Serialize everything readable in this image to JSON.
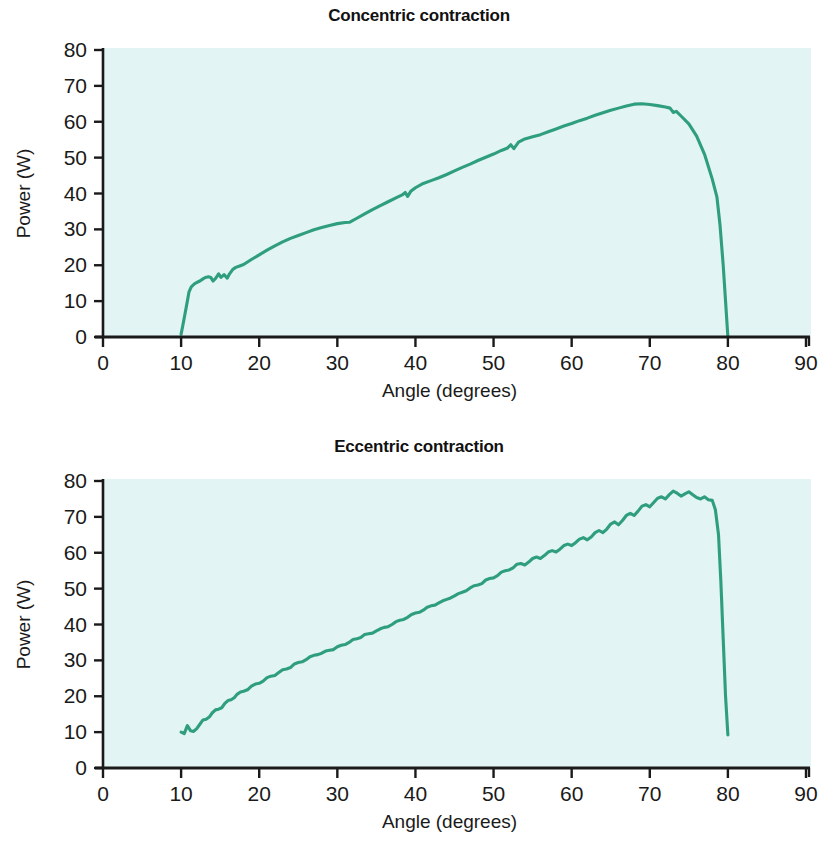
{
  "figure": {
    "background": "#ffffff",
    "plot_background": "#e2f4f3",
    "line_color": "#2e9e7e",
    "axis_color": "#1a1a1a"
  },
  "charts": [
    {
      "id": "concentric",
      "title": "Concentric contraction",
      "xlabel": "Angle (degrees)",
      "ylabel": "Power (W)",
      "xticks": [
        "0",
        "10",
        "20",
        "30",
        "40",
        "50",
        "60",
        "70",
        "80",
        "90"
      ],
      "yticks": [
        "0",
        "10",
        "20",
        "30",
        "40",
        "50",
        "60",
        "70",
        "80"
      ]
    },
    {
      "id": "eccentric",
      "title": "Eccentric contraction",
      "xlabel": "Angle (degrees)",
      "ylabel": "Power (W)",
      "xticks": [
        "0",
        "10",
        "20",
        "30",
        "40",
        "50",
        "60",
        "70",
        "80",
        "90"
      ],
      "yticks": [
        "0",
        "10",
        "20",
        "30",
        "40",
        "50",
        "60",
        "70",
        "80"
      ]
    }
  ],
  "chart_data": [
    {
      "type": "line",
      "title": "Concentric contraction",
      "xlabel": "Angle (degrees)",
      "ylabel": "Power (W)",
      "xlim": [
        0,
        90
      ],
      "ylim": [
        0,
        80
      ],
      "xticks": [
        0,
        10,
        20,
        30,
        40,
        50,
        60,
        70,
        80,
        90
      ],
      "yticks": [
        0,
        10,
        20,
        30,
        40,
        50,
        60,
        70,
        80
      ],
      "grid": false,
      "legend": null,
      "series": [
        {
          "name": "Power",
          "x": [
            10.0,
            10.2,
            10.5,
            10.8,
            11.0,
            11.3,
            11.7,
            12.0,
            12.4,
            12.8,
            13.1,
            13.5,
            13.8,
            14.1,
            14.4,
            14.8,
            15.1,
            15.5,
            15.9,
            16.2,
            16.6,
            17.0,
            17.5,
            18.0,
            19.0,
            20.0,
            21.0,
            22.0,
            23.0,
            24.0,
            25.0,
            26.0,
            27.0,
            28.0,
            29.0,
            30.0,
            31.0,
            31.6,
            32.5,
            33.5,
            34.5,
            35.5,
            36.5,
            37.5,
            38.3,
            38.7,
            39.0,
            39.4,
            40.0,
            41.0,
            42.0,
            43.0,
            44.0,
            45.0,
            46.0,
            47.0,
            48.0,
            49.0,
            50.0,
            51.0,
            51.8,
            52.2,
            52.6,
            53.2,
            54.0,
            55.0,
            56.0,
            57.0,
            58.0,
            59.0,
            60.0,
            61.0,
            62.0,
            63.0,
            64.0,
            65.0,
            66.0,
            67.0,
            68.0,
            69.0,
            70.0,
            71.0,
            72.0,
            72.6,
            73.0,
            73.4,
            74.0,
            75.0,
            76.0,
            77.0,
            78.0,
            78.6,
            79.0,
            79.4,
            79.7,
            80.0
          ],
          "y": [
            0.8,
            3.0,
            6.5,
            10.0,
            12.5,
            14.0,
            14.8,
            15.2,
            15.6,
            16.2,
            16.6,
            16.8,
            16.6,
            15.6,
            16.3,
            17.6,
            16.6,
            17.4,
            16.4,
            17.6,
            18.8,
            19.4,
            19.8,
            20.2,
            21.6,
            22.9,
            24.2,
            25.4,
            26.5,
            27.5,
            28.3,
            29.1,
            29.9,
            30.5,
            31.1,
            31.6,
            31.9,
            32.0,
            33.1,
            34.3,
            35.5,
            36.6,
            37.7,
            38.8,
            39.6,
            40.3,
            39.2,
            40.6,
            41.6,
            42.8,
            43.6,
            44.4,
            45.3,
            46.3,
            47.3,
            48.2,
            49.2,
            50.1,
            51.0,
            52.0,
            52.7,
            53.6,
            52.5,
            54.3,
            55.2,
            55.8,
            56.4,
            57.2,
            58.0,
            58.8,
            59.5,
            60.3,
            61.0,
            61.8,
            62.5,
            63.2,
            63.8,
            64.4,
            64.9,
            65.0,
            64.8,
            64.5,
            64.1,
            63.8,
            62.6,
            62.9,
            61.6,
            59.4,
            56.0,
            51.0,
            44.0,
            39.0,
            31.0,
            20.0,
            10.0,
            0.0
          ]
        }
      ]
    },
    {
      "type": "line",
      "title": "Eccentric contraction",
      "xlabel": "Angle (degrees)",
      "ylabel": "Power (W)",
      "xlim": [
        0,
        90
      ],
      "ylim": [
        0,
        80
      ],
      "xticks": [
        0,
        10,
        20,
        30,
        40,
        50,
        60,
        70,
        80,
        90
      ],
      "yticks": [
        0,
        10,
        20,
        30,
        40,
        50,
        60,
        70,
        80
      ],
      "grid": false,
      "legend": null,
      "series": [
        {
          "name": "Power",
          "x": [
            10.0,
            10.4,
            10.8,
            11.2,
            11.6,
            12.0,
            12.4,
            12.8,
            13.2,
            13.6,
            14.0,
            14.4,
            14.8,
            15.2,
            15.6,
            16.0,
            16.4,
            16.8,
            17.2,
            17.6,
            18.0,
            18.5,
            19.0,
            19.5,
            20.0,
            20.5,
            21.0,
            21.5,
            22.0,
            22.5,
            23.0,
            23.5,
            24.0,
            24.5,
            25.0,
            25.5,
            26.0,
            26.5,
            27.0,
            27.5,
            28.0,
            28.5,
            29.0,
            29.5,
            30.0,
            30.5,
            31.0,
            31.5,
            32.0,
            32.5,
            33.0,
            33.5,
            34.0,
            34.5,
            35.0,
            35.5,
            36.0,
            36.5,
            37.0,
            37.5,
            38.0,
            38.5,
            39.0,
            39.5,
            40.0,
            40.5,
            41.0,
            41.5,
            42.0,
            42.5,
            43.0,
            43.5,
            44.0,
            44.5,
            45.0,
            45.5,
            46.0,
            46.5,
            47.0,
            47.5,
            48.0,
            48.5,
            49.0,
            49.5,
            50.0,
            50.5,
            51.0,
            51.5,
            52.0,
            52.5,
            53.0,
            53.5,
            54.0,
            54.5,
            55.0,
            55.5,
            56.0,
            56.5,
            57.0,
            57.5,
            58.0,
            58.5,
            59.0,
            59.5,
            60.0,
            60.5,
            61.0,
            61.5,
            62.0,
            62.5,
            63.0,
            63.5,
            64.0,
            64.5,
            65.0,
            65.5,
            66.0,
            66.5,
            67.0,
            67.5,
            68.0,
            68.5,
            69.0,
            69.5,
            70.0,
            70.5,
            71.0,
            71.5,
            72.0,
            72.5,
            73.0,
            73.5,
            74.0,
            74.5,
            75.0,
            75.5,
            76.0,
            76.5,
            77.0,
            77.5,
            78.0,
            78.4,
            78.8,
            79.1,
            79.4,
            79.7,
            80.0
          ],
          "y": [
            10.0,
            9.6,
            11.8,
            10.4,
            10.2,
            11.0,
            12.2,
            13.4,
            13.6,
            14.2,
            15.4,
            16.2,
            16.4,
            16.8,
            18.0,
            18.8,
            19.0,
            19.6,
            20.6,
            21.2,
            21.4,
            21.8,
            22.8,
            23.4,
            23.6,
            24.2,
            25.2,
            25.6,
            25.8,
            26.6,
            27.4,
            27.6,
            28.0,
            29.0,
            29.4,
            29.6,
            30.2,
            31.0,
            31.4,
            31.6,
            32.0,
            32.6,
            32.8,
            33.0,
            33.8,
            34.2,
            34.4,
            35.0,
            35.8,
            36.0,
            36.4,
            37.2,
            37.4,
            37.6,
            38.2,
            38.8,
            39.2,
            39.4,
            40.0,
            40.8,
            41.2,
            41.4,
            42.0,
            42.8,
            43.2,
            43.4,
            44.0,
            44.8,
            45.2,
            45.4,
            46.0,
            46.6,
            47.0,
            47.4,
            48.0,
            48.6,
            49.0,
            49.4,
            50.2,
            50.8,
            51.0,
            51.4,
            52.4,
            52.8,
            53.0,
            53.6,
            54.6,
            55.0,
            55.2,
            55.8,
            56.8,
            57.0,
            56.6,
            57.4,
            58.4,
            58.8,
            58.4,
            59.2,
            60.2,
            60.6,
            60.2,
            61.0,
            62.0,
            62.4,
            62.0,
            62.8,
            63.8,
            64.2,
            63.6,
            64.4,
            65.6,
            66.2,
            65.6,
            66.6,
            68.0,
            68.6,
            67.8,
            69.0,
            70.4,
            71.0,
            70.4,
            71.6,
            73.0,
            73.4,
            72.8,
            74.0,
            75.2,
            75.6,
            75.0,
            76.2,
            77.2,
            76.6,
            75.8,
            76.4,
            77.0,
            76.2,
            75.4,
            75.0,
            75.6,
            74.8,
            74.6,
            72.0,
            65.0,
            52.0,
            36.0,
            20.0,
            9.2
          ]
        }
      ]
    }
  ]
}
